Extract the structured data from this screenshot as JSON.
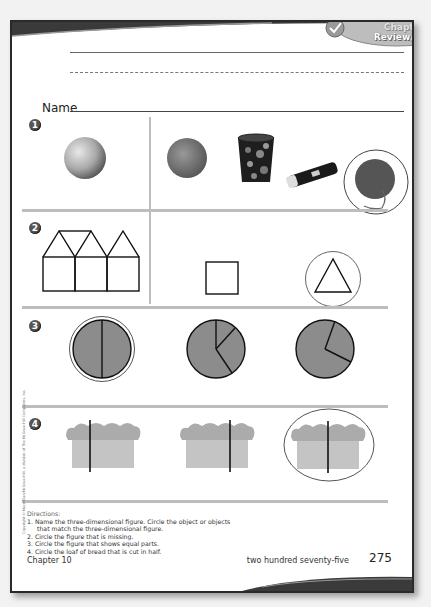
{
  "header": {
    "badge_line1": "Chapter",
    "badge_line2": "Review/Test"
  },
  "name_field": {
    "label": "Name"
  },
  "problems": [
    {
      "number": "1",
      "left_figure": "sphere-ball",
      "choices": [
        "orange",
        "cylinder-tin-can",
        "flashlight",
        "ball-of-yarn"
      ],
      "circled": "ball-of-yarn"
    },
    {
      "number": "2",
      "left_figure": "three-houses-pattern",
      "choices": [
        "square",
        "triangle"
      ],
      "circled": "triangle"
    },
    {
      "number": "3",
      "choices": [
        "circle-halves",
        "circle-three-unequal-parts",
        "circle-two-unequal-parts"
      ],
      "circled": "circle-halves"
    },
    {
      "number": "4",
      "choices": [
        "bread-cut-left",
        "bread-cut-right",
        "bread-cut-middle"
      ],
      "circled": "bread-cut-middle"
    }
  ],
  "directions": {
    "title": "Directions:",
    "items": [
      {
        "num": "1.",
        "text": "Name the three-dimensional figure. Circle the object or objects",
        "cont": "that match the three-dimensional figure."
      },
      {
        "num": "2.",
        "text": "Circle the figure that is missing."
      },
      {
        "num": "3.",
        "text": "Circle the figure that shows equal parts."
      },
      {
        "num": "4.",
        "text": "Circle the loaf of bread that is cut in half."
      }
    ]
  },
  "footer": {
    "chapter": "Chapter 10",
    "page_words": "two hundred seventy-five",
    "page_number": "275"
  },
  "copyright": "Copyright © Macmillan/McGraw-Hill, a division of The McGraw-Hill Companies, Inc.",
  "colors": {
    "pie_fill": "#8c8c8c",
    "bread_fill": "#bdbdbd",
    "separator": "#bdbdbd",
    "border": "#2a2a2a"
  }
}
